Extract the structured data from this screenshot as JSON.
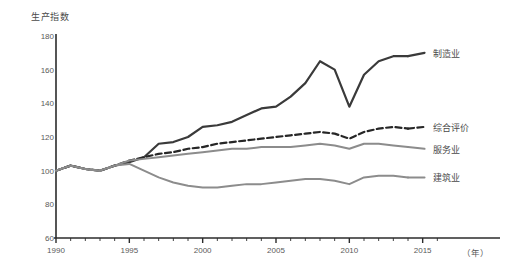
{
  "chart_data": {
    "type": "line",
    "title": "",
    "ylabel": "生产指数",
    "xlabel": "（年）",
    "grid": false,
    "legend_position": "right-inline",
    "xlim": [
      1990,
      2017
    ],
    "ylim": [
      60,
      180
    ],
    "yticks": [
      60,
      80,
      100,
      120,
      140,
      160,
      180
    ],
    "ytick_labels": [
      "60",
      "80",
      "100",
      "120",
      "140",
      "160",
      "180"
    ],
    "xticks": [
      1990,
      1995,
      2000,
      2005,
      2010,
      2015
    ],
    "xtick_labels": [
      "1990",
      "1995",
      "2000",
      "2005",
      "2010",
      "2015"
    ],
    "x": [
      1990,
      1991,
      1992,
      1993,
      1994,
      1995,
      1996,
      1997,
      1998,
      1999,
      2000,
      2001,
      2002,
      2003,
      2004,
      2005,
      2006,
      2007,
      2008,
      2009,
      2010,
      2011,
      2012,
      2013,
      2014
    ],
    "series": [
      {
        "name": "制造业",
        "style": "solid",
        "color": "#3a3a3a",
        "width": 2.2,
        "label_x": 2015.4,
        "label_y": 170,
        "values": [
          100,
          103,
          101,
          100,
          103,
          105,
          108,
          116,
          117,
          120,
          126,
          127,
          129,
          133,
          137,
          138,
          144,
          152,
          165,
          160,
          138,
          157,
          165,
          168,
          168
        ]
      },
      {
        "name": "综合评价",
        "style": "dashed",
        "color": "#262626",
        "width": 2.2,
        "label_x": 2015.4,
        "label_y": 126,
        "values": [
          100,
          103,
          101,
          100,
          103,
          106,
          108,
          110,
          111,
          113,
          114,
          116,
          117,
          118,
          119,
          120,
          121,
          122,
          123,
          122,
          119,
          123,
          125,
          126,
          125
        ]
      },
      {
        "name": "服务业",
        "style": "solid",
        "color": "#8c8c8c",
        "width": 2.0,
        "label_x": 2015.4,
        "label_y": 113,
        "values": [
          100,
          103,
          101,
          100,
          103,
          106,
          107,
          108,
          109,
          110,
          111,
          112,
          113,
          113,
          114,
          114,
          114,
          115,
          116,
          115,
          113,
          116,
          116,
          115,
          114
        ]
      },
      {
        "name": "建筑业",
        "style": "solid",
        "color": "#8c8c8c",
        "width": 2.0,
        "label_x": 2015.4,
        "label_y": 96,
        "values": [
          100,
          103,
          101,
          100,
          103,
          104,
          100,
          96,
          93,
          91,
          90,
          90,
          91,
          92,
          92,
          93,
          94,
          95,
          95,
          94,
          92,
          96,
          97,
          97,
          96
        ]
      }
    ]
  },
  "axes": {
    "y_title": "生产指数",
    "x_unit": "（年）"
  }
}
